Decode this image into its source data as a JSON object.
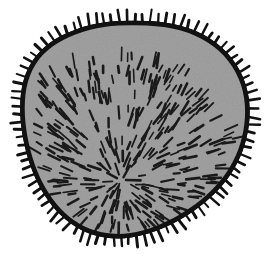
{
  "figure": {
    "title": "Spiny spherical microorganism line drawing",
    "caption": "Gray-filled irregular spheroid with thick black outline, radial peripheral spines and interior radiating hair-like strokes",
    "subject_name": "spiny-spheroid-organism",
    "background_color": "#ffffff",
    "canvas": {
      "width": 269,
      "height": 278
    }
  },
  "body": {
    "name": "cell-body",
    "fill_color": "#9a9a9a",
    "outline_color": "#111111",
    "outline_width": 4.6,
    "center_x": 134,
    "center_y": 142,
    "radius_x": 113,
    "radius_y": 119,
    "outline_points": [
      [
        134.0,
        23.0
      ],
      [
        150.0,
        23.4
      ],
      [
        166.0,
        25.0
      ],
      [
        181.5,
        28.4
      ],
      [
        196.0,
        33.6
      ],
      [
        209.0,
        40.6
      ],
      [
        220.5,
        49.4
      ],
      [
        230.2,
        59.8
      ],
      [
        237.8,
        71.6
      ],
      [
        243.2,
        84.4
      ],
      [
        246.4,
        97.8
      ],
      [
        247.4,
        111.4
      ],
      [
        246.6,
        124.8
      ],
      [
        244.2,
        137.8
      ],
      [
        240.4,
        150.2
      ],
      [
        235.2,
        162.0
      ],
      [
        228.6,
        173.2
      ],
      [
        220.8,
        183.6
      ],
      [
        211.8,
        193.2
      ],
      [
        201.8,
        202.0
      ],
      [
        191.0,
        210.0
      ],
      [
        179.6,
        217.2
      ],
      [
        167.8,
        223.4
      ],
      [
        155.6,
        228.6
      ],
      [
        143.2,
        232.6
      ],
      [
        130.8,
        235.2
      ],
      [
        118.4,
        236.2
      ],
      [
        106.2,
        235.4
      ],
      [
        94.4,
        232.8
      ],
      [
        83.2,
        228.4
      ],
      [
        72.8,
        222.2
      ],
      [
        63.2,
        214.4
      ],
      [
        54.6,
        205.2
      ],
      [
        47.0,
        194.8
      ],
      [
        40.4,
        183.4
      ],
      [
        34.8,
        171.0
      ],
      [
        30.2,
        157.8
      ],
      [
        26.6,
        144.0
      ],
      [
        24.0,
        129.8
      ],
      [
        22.6,
        115.4
      ],
      [
        22.6,
        101.2
      ],
      [
        24.2,
        87.6
      ],
      [
        27.8,
        74.8
      ],
      [
        33.6,
        63.2
      ],
      [
        41.6,
        53.0
      ],
      [
        51.6,
        44.4
      ],
      [
        63.2,
        37.4
      ],
      [
        76.0,
        31.8
      ],
      [
        89.6,
        27.6
      ],
      [
        103.8,
        24.8
      ],
      [
        118.6,
        23.3
      ]
    ]
  },
  "spines": {
    "name": "peripheral-spines",
    "color": "#111111",
    "count": 92,
    "length_min": 8,
    "length_max": 14,
    "width": 2.4,
    "description": "Short straight bristles projecting radially outward from the outline"
  },
  "interior_strokes": {
    "name": "interior-radial-hairs",
    "color": "#1a1a1a",
    "count": 330,
    "length_min": 6,
    "length_max": 15,
    "width": 2.1,
    "radial_origin_x": 120,
    "radial_origin_y": 182,
    "description": "Short dashes oriented along radii emanating from an off-center focus below and left of the body center"
  },
  "texture": {
    "name": "fill-noise",
    "description": "Subtle scanned-paper grain over the gray fill",
    "opacity": 0.12
  }
}
